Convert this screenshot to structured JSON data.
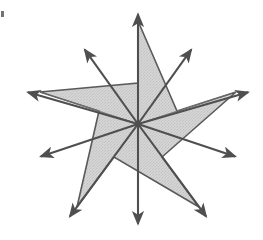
{
  "figure": {
    "canvas": {
      "width": 263,
      "height": 240,
      "background": "#ffffff"
    },
    "style": {
      "star_fill": "#d2d2d2",
      "star_fill_alt": "#c9c9c9",
      "star_stroke": "#5a5a5a",
      "star_stroke_width": 1.6,
      "arrow_stroke": "#4f4f4f",
      "arrow_stroke_width": 2.1,
      "arrow_head_fill": "#4f4f4f",
      "arrow_head_length": 15,
      "arrow_head_width": 9
    },
    "center": {
      "x": 138,
      "y": 124,
      "label": "center"
    },
    "star": {
      "points": 5,
      "outer_radius": 103,
      "inner_radius": 41,
      "rotation_deg": -90,
      "outer_vertices": [
        {
          "name": "top-point",
          "x": 138,
          "y": 21
        },
        {
          "name": "right-point",
          "x": 236,
          "y": 92
        },
        {
          "name": "bottom-right-point",
          "x": 199,
          "y": 207
        },
        {
          "name": "bottom-left-point",
          "x": 77,
          "y": 207
        },
        {
          "name": "left-point",
          "x": 40,
          "y": 92
        }
      ],
      "inner_vertices": [
        {
          "name": "notch-upper-right",
          "x": 177,
          "y": 111
        },
        {
          "name": "notch-lower-right",
          "x": 162,
          "y": 157
        },
        {
          "name": "notch-bottom",
          "x": 114,
          "y": 157
        },
        {
          "name": "notch-lower-left",
          "x": 99,
          "y": 111
        },
        {
          "name": "notch-upper-left",
          "x": 138,
          "y": 83
        }
      ]
    },
    "arrows": {
      "count": 10,
      "note": "Each arrow starts at the star center and points outward; tips land outside the star silhouette.",
      "items": [
        {
          "name": "arrow-up",
          "direction_deg": -90,
          "tip": {
            "x": 138,
            "y": 6
          },
          "length": 118
        },
        {
          "name": "arrow-upper-right",
          "direction_deg": -54,
          "tip": {
            "x": 196,
            "y": 43
          },
          "length": 99
        },
        {
          "name": "arrow-right",
          "direction_deg": -18,
          "tip": {
            "x": 256,
            "y": 90
          },
          "length": 124
        },
        {
          "name": "arrow-lower-right",
          "direction_deg": 18,
          "tip": {
            "x": 243,
            "y": 159
          },
          "length": 110
        },
        {
          "name": "arrow-down-right",
          "direction_deg": 54,
          "tip": {
            "x": 211,
            "y": 223
          },
          "length": 120
        },
        {
          "name": "arrow-down",
          "direction_deg": 90,
          "tip": {
            "x": 138,
            "y": 232
          },
          "length": 108
        },
        {
          "name": "arrow-down-left",
          "direction_deg": 126,
          "tip": {
            "x": 65,
            "y": 223
          },
          "length": 120
        },
        {
          "name": "arrow-lower-left",
          "direction_deg": 162,
          "tip": {
            "x": 33,
            "y": 159
          },
          "length": 110
        },
        {
          "name": "arrow-left",
          "direction_deg": 198,
          "tip": {
            "x": 20,
            "y": 90
          },
          "length": 124
        },
        {
          "name": "arrow-upper-left",
          "direction_deg": 234,
          "tip": {
            "x": 80,
            "y": 43
          },
          "length": 99
        }
      ]
    },
    "artifacts": [
      {
        "name": "scan-speck",
        "x": 1,
        "y": 11,
        "width": 3,
        "height": 6,
        "color": "#5a5a5a"
      }
    ]
  }
}
